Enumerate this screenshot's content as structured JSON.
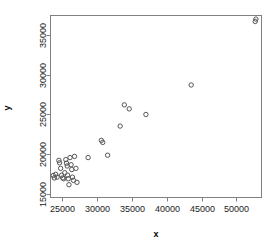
{
  "chart_data": {
    "type": "scatter",
    "title": "",
    "xlabel": "x",
    "ylabel": "y",
    "xlim": [
      23300,
      53600
    ],
    "ylim": [
      14600,
      37400
    ],
    "grid": false,
    "legend": null,
    "xticks": [
      25000,
      30000,
      35000,
      40000,
      45000,
      50000
    ],
    "yticks": [
      15000,
      20000,
      25000,
      30000,
      35000
    ],
    "xticklabels": [
      "25000",
      "30000",
      "35000",
      "40000",
      "45000",
      "50000"
    ],
    "yticklabels": [
      "15000",
      "20000",
      "25000",
      "30000",
      "35000"
    ],
    "marker": "open-circle",
    "marker_color": "#555555",
    "point_count": 34,
    "points": [
      {
        "x": 23700,
        "y": 17350
      },
      {
        "x": 23850,
        "y": 17050
      },
      {
        "x": 24050,
        "y": 17500
      },
      {
        "x": 24250,
        "y": 17150
      },
      {
        "x": 24500,
        "y": 19250
      },
      {
        "x": 24600,
        "y": 18950
      },
      {
        "x": 24750,
        "y": 18250
      },
      {
        "x": 24900,
        "y": 17400
      },
      {
        "x": 25050,
        "y": 17050
      },
      {
        "x": 25200,
        "y": 16950
      },
      {
        "x": 25350,
        "y": 17700
      },
      {
        "x": 25500,
        "y": 19350
      },
      {
        "x": 25600,
        "y": 18900
      },
      {
        "x": 25700,
        "y": 18550
      },
      {
        "x": 25750,
        "y": 17400
      },
      {
        "x": 25850,
        "y": 16950
      },
      {
        "x": 25950,
        "y": 16200
      },
      {
        "x": 26100,
        "y": 19600
      },
      {
        "x": 26250,
        "y": 18700
      },
      {
        "x": 26350,
        "y": 18100
      },
      {
        "x": 26450,
        "y": 17150
      },
      {
        "x": 26600,
        "y": 16750
      },
      {
        "x": 26750,
        "y": 19750
      },
      {
        "x": 26950,
        "y": 18250
      },
      {
        "x": 27100,
        "y": 16500
      },
      {
        "x": 28700,
        "y": 19600
      },
      {
        "x": 30600,
        "y": 21750
      },
      {
        "x": 30800,
        "y": 21500
      },
      {
        "x": 31500,
        "y": 19900
      },
      {
        "x": 33300,
        "y": 23550
      },
      {
        "x": 33900,
        "y": 26200
      },
      {
        "x": 34600,
        "y": 25700
      },
      {
        "x": 37000,
        "y": 25000
      },
      {
        "x": 43500,
        "y": 28700
      },
      {
        "x": 52700,
        "y": 36650
      },
      {
        "x": 52800,
        "y": 36950
      }
    ]
  }
}
